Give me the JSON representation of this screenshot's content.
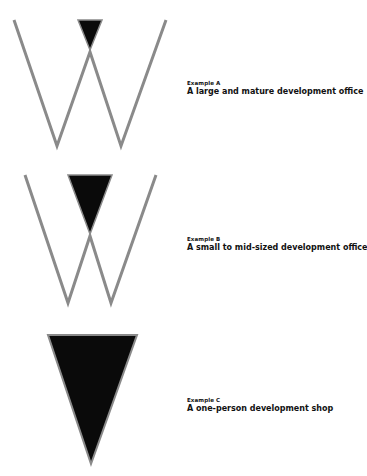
{
  "colors": {
    "stroke": "#8a8a8a",
    "fill": "#0a0a0a",
    "text": "#111111"
  },
  "examples": [
    {
      "label": "Example A",
      "description": "A large and mature development office",
      "shape": "W with small black triangle at top center"
    },
    {
      "label": "Example B",
      "description": "A small to mid-sized development office",
      "shape": "W with medium black triangle at top center"
    },
    {
      "label": "Example C",
      "description": "A one-person development shop",
      "shape": "single large black inverted triangle"
    }
  ]
}
